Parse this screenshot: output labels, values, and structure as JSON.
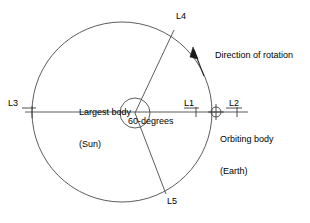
{
  "diagram": {
    "background_color": "#ffffff",
    "stroke_color": "#3a3a3a",
    "text_color": "#000000",
    "labels": {
      "l1": "L1",
      "l2": "L2",
      "l3": "L3",
      "l4": "L4",
      "l5": "L5",
      "largest_body_line1": "Largest body",
      "largest_body_line2": "(Sun)",
      "orbiting_body_line1": "Orbiting body",
      "orbiting_body_line2": "(Earth)",
      "angle": "60-degrees",
      "rotation": "Direction of rotation"
    },
    "geometry": {
      "orbit_center_x": 122,
      "orbit_center_y": 112,
      "orbit_radius": 90,
      "sun_center_x": 135,
      "sun_center_y": 113,
      "sun_radius": 15,
      "earth_x": 216,
      "earth_y": 112,
      "earth_radius": 5,
      "l1_tick_x": 196,
      "l2_tick_x": 237,
      "l3_tick_x": 32,
      "l4_x": 174,
      "l4_y": 30,
      "l5_x": 166,
      "l5_y": 194,
      "axis_left_x": 25,
      "axis_right_x": 248,
      "axis_y": 112,
      "angle_degrees": 60
    }
  }
}
